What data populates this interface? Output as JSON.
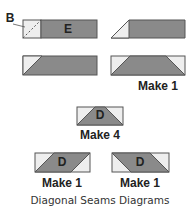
{
  "colors": {
    "gray": "#8a8a8a",
    "light": "#eeeeee",
    "stroke": "#555555",
    "text": "#222222"
  },
  "labels": {
    "b": "B",
    "e": "E",
    "d_mid": "D",
    "d_left": "D",
    "d_right": "D"
  },
  "captions": {
    "row2_right": "Make 1",
    "middle": "Make 4",
    "bottom_left": "Make 1",
    "bottom_right": "Make 1",
    "title": "Diagonal Seams Diagrams"
  }
}
